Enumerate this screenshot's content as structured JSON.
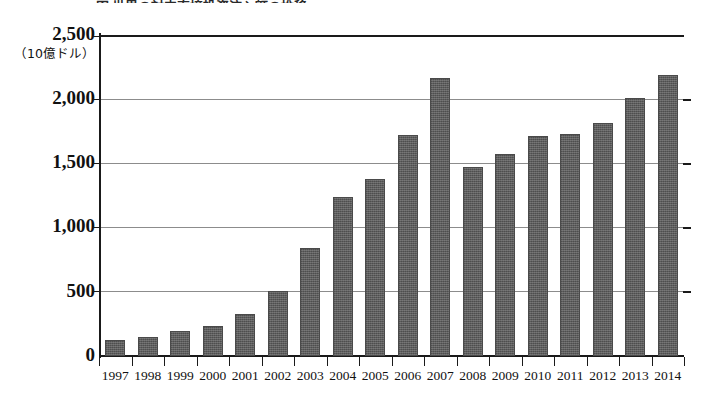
{
  "figure": {
    "title_cutoff": "図 世界の対内直接投資流入額の推移",
    "unit_label": "（10億ドル）"
  },
  "chart_data": {
    "type": "bar",
    "title": "",
    "xlabel": "",
    "ylabel": "（10億ドル）",
    "ylim": [
      0,
      2500
    ],
    "ytick_values": [
      0,
      500,
      1000,
      1500,
      2000,
      2500
    ],
    "ytick_labels": [
      "0",
      "500",
      "1,000",
      "1,500",
      "2,000",
      "2,500"
    ],
    "grid": true,
    "legend": "none",
    "bar_color": "#5d5d5d",
    "categories": [
      "1997",
      "1998",
      "1999",
      "2000",
      "2001",
      "2002",
      "2003",
      "2004",
      "2005",
      "2006",
      "2007",
      "2008",
      "2009",
      "2010",
      "2011",
      "2012",
      "2013",
      "2014"
    ],
    "values": [
      125,
      150,
      195,
      235,
      330,
      510,
      840,
      1240,
      1375,
      1725,
      2165,
      1470,
      1570,
      1710,
      1730,
      1815,
      2010,
      2190
    ]
  }
}
